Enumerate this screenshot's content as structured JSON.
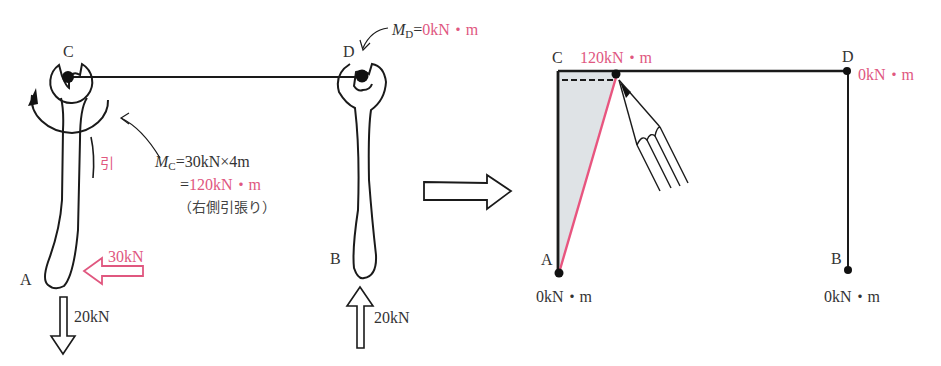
{
  "colors": {
    "ink": "#1a1a1a",
    "accent_pink": "#e0577f",
    "diagram_fill": "#dfe3e6"
  },
  "left_figure": {
    "nodes": {
      "C": "C",
      "D": "D",
      "A": "A",
      "B": "B"
    },
    "moment_D": {
      "symbol": "M",
      "subscript": "D",
      "equals": "=",
      "value": "0kN・m"
    },
    "moment_C": {
      "symbol": "M",
      "subscript": "C",
      "line1_rest": "=30kN×4m",
      "line2_equals": "=",
      "line2_value": "120kN・m",
      "line3_note": "（右側引張り）"
    },
    "tension_mark": "引",
    "forces": {
      "horizontal_A": "30kN",
      "vertical_A": "20kN",
      "vertical_B": "20kN"
    }
  },
  "transition_arrow": "arrow-right-icon",
  "right_figure": {
    "nodes": {
      "C": "C",
      "D": "D",
      "A": "A",
      "B": "B"
    },
    "moments": {
      "C": "120kN・m",
      "D": "0kN・m",
      "A": "0kN・m",
      "B": "0kN・m"
    }
  }
}
